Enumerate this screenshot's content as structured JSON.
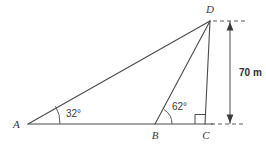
{
  "diagram": {
    "type": "geometry-triangle-elevation",
    "background_color": "#ffffff",
    "stroke_color": "#4a4a4a",
    "text_color": "#3a3a3a",
    "vertices": [
      {
        "name": "A",
        "label": "A",
        "x": 28,
        "y": 124
      },
      {
        "name": "B",
        "label": "B",
        "x": 155,
        "y": 124
      },
      {
        "name": "C",
        "label": "C",
        "x": 205,
        "y": 124
      },
      {
        "name": "D",
        "label": "D",
        "x": 210,
        "y": 21
      }
    ],
    "angles": [
      {
        "at": "A",
        "label": "32°",
        "value": 32,
        "arc_radius": 32
      },
      {
        "at": "B",
        "label": "62°",
        "value": 62,
        "arc_radius": 17
      },
      {
        "at": "C",
        "label": "",
        "value": 90,
        "marker": "right-angle-square"
      }
    ],
    "dimension": {
      "label": "70 m",
      "value": 70,
      "unit": "m",
      "from": "C",
      "to": "D",
      "orientation": "vertical"
    },
    "labels": {
      "vertex_a": "A",
      "vertex_b": "B",
      "vertex_c": "C",
      "vertex_d": "D",
      "angle_a": "32°",
      "angle_b": "62°",
      "height": "70 m"
    }
  }
}
